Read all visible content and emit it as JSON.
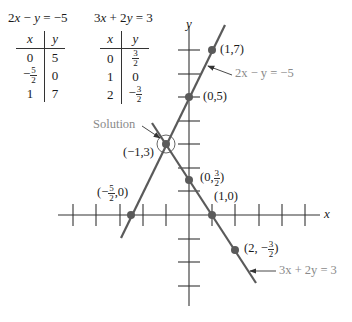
{
  "equations": {
    "eq1": {
      "text_left": "2",
      "x": "x",
      "mid": " − ",
      "y": "y",
      "rhs": " = −5"
    },
    "eq2": {
      "text_left": "3",
      "x": "x",
      "mid": " + 2",
      "y": "y",
      "rhs": " = 3"
    }
  },
  "table1": {
    "headers": [
      "x",
      "y"
    ],
    "rows": [
      {
        "x": "0",
        "y": "5"
      },
      {
        "x_sign": "−",
        "x_num": "5",
        "x_den": "2",
        "y": "0"
      },
      {
        "x": "1",
        "y": "7"
      }
    ]
  },
  "table2": {
    "headers": [
      "x",
      "y"
    ],
    "rows": [
      {
        "x": "0",
        "y_num": "3",
        "y_den": "2"
      },
      {
        "x": "1",
        "y": "0"
      },
      {
        "x": "2",
        "y_sign": "−",
        "y_num": "3",
        "y_den": "2"
      }
    ]
  },
  "axes": {
    "x_label": "x",
    "y_label": "y"
  },
  "points": {
    "p17": "(1,7)",
    "p05": "(0,5)",
    "pm13": "(−1,3)",
    "p0_32_prefix": "(0,",
    "p0_32_num": "3",
    "p0_32_den": "2",
    "p0_32_suffix": ")",
    "pm52_prefix": "(−",
    "pm52_num": "5",
    "pm52_den": "2",
    "pm52_suffix": ",0)",
    "p10": "(1,0)",
    "p2m32_prefix": "(2, −",
    "p2m32_num": "3",
    "p2m32_den": "2",
    "p2m32_suffix": ")"
  },
  "annotations": {
    "solution": "Solution",
    "line1": "2x − y = −5",
    "line2": "3x + 2y = 3"
  },
  "colors": {
    "line": "#5a5a5a",
    "axis": "#333333",
    "annotation": "#8a8a8a",
    "point": "#5a5a5a"
  }
}
